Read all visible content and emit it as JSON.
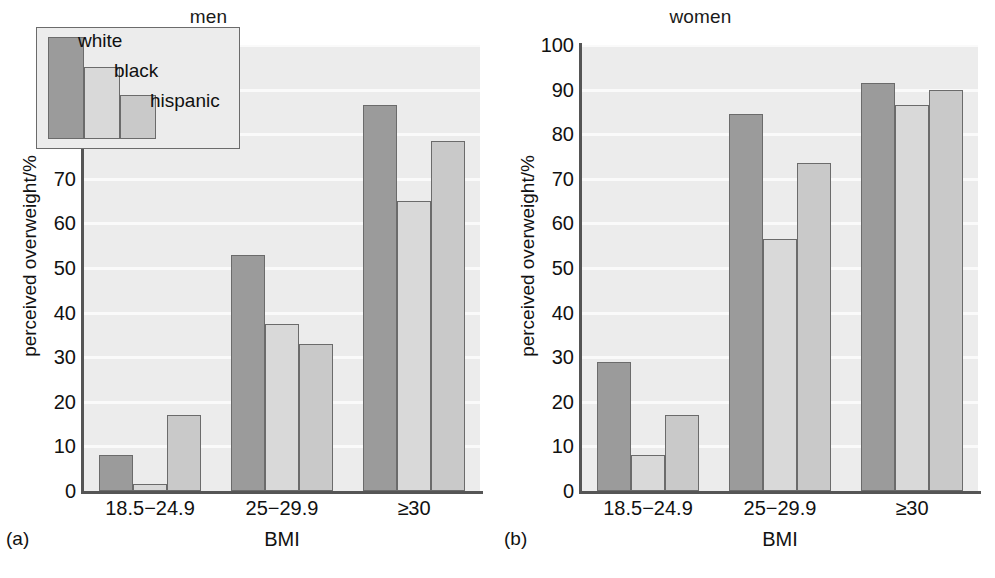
{
  "chart_data": {
    "type": "bar",
    "title": "",
    "grid": true,
    "legend_position": "inside-top-left-panel-a",
    "legend_entries": [
      "white",
      "black",
      "hispanic"
    ],
    "xlabel": "BMI",
    "ylabel": "perceived overweight/%",
    "categories": [
      "18.5−24.9",
      "25−29.9",
      "≥30"
    ],
    "ylim": [
      0,
      100
    ],
    "yticks": [
      0,
      10,
      20,
      30,
      40,
      50,
      60,
      70,
      80,
      90,
      100
    ],
    "panels": [
      {
        "caption": "(a)",
        "title": "men",
        "series": [
          {
            "name": "white",
            "values": [
              8,
              53,
              86.5
            ]
          },
          {
            "name": "black",
            "values": [
              1.5,
              37.5,
              65
            ]
          },
          {
            "name": "hispanic",
            "values": [
              17,
              33,
              78.5
            ]
          }
        ]
      },
      {
        "caption": "(b)",
        "title": "women",
        "series": [
          {
            "name": "white",
            "values": [
              29,
              84.5,
              91.5
            ]
          },
          {
            "name": "black",
            "values": [
              8,
              56.5,
              86.5
            ]
          },
          {
            "name": "hispanic",
            "values": [
              17,
              73.5,
              90
            ]
          }
        ]
      }
    ]
  },
  "colors": {
    "white_series": "#9b9b9b",
    "black_series": "#d9d9d9",
    "hispanic_series": "#c9c9c9",
    "plot_background": "#ececec",
    "gridline": "#fafafa",
    "axis": "#555555",
    "text": "#111111"
  }
}
